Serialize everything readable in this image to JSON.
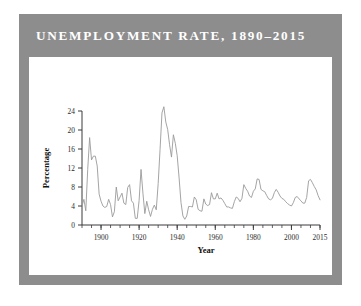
{
  "figure": {
    "title": "UNEMPLOYMENT RATE, 1890–2015",
    "frame_color": "#8d8d8d",
    "title_color": "#ffffff",
    "card_color": "#ffffff",
    "page_background": "#ffffff"
  },
  "chart_data": {
    "type": "line",
    "title": "UNEMPLOYMENT RATE, 1890–2015",
    "xlabel": "Year",
    "ylabel": "Percentage",
    "xlim": [
      1890,
      2015
    ],
    "ylim": [
      0,
      24
    ],
    "xticks": [
      1900,
      1920,
      1940,
      1960,
      1980,
      2000,
      2015
    ],
    "xtick_labels": [
      "1900",
      "1920",
      "1940",
      "1960",
      "1980",
      "2000",
      "2015"
    ],
    "yticks": [
      0,
      4,
      8,
      12,
      16,
      20,
      24
    ],
    "ytick_labels": [
      "0",
      "4",
      "8",
      "12",
      "16",
      "20",
      "24"
    ],
    "x_minor_tick_step": 5,
    "grid": false,
    "legend": false,
    "line_color": "#9a9a9a",
    "series": [
      {
        "name": "Unemployment rate",
        "x": [
          1890,
          1891,
          1892,
          1893,
          1894,
          1895,
          1896,
          1897,
          1898,
          1899,
          1900,
          1901,
          1902,
          1903,
          1904,
          1905,
          1906,
          1907,
          1908,
          1909,
          1910,
          1911,
          1912,
          1913,
          1914,
          1915,
          1916,
          1917,
          1918,
          1919,
          1920,
          1921,
          1922,
          1923,
          1924,
          1925,
          1926,
          1927,
          1928,
          1929,
          1930,
          1931,
          1932,
          1933,
          1934,
          1935,
          1936,
          1937,
          1938,
          1939,
          1940,
          1941,
          1942,
          1943,
          1944,
          1945,
          1946,
          1947,
          1948,
          1949,
          1950,
          1951,
          1952,
          1953,
          1954,
          1955,
          1956,
          1957,
          1958,
          1959,
          1960,
          1961,
          1962,
          1963,
          1964,
          1965,
          1966,
          1967,
          1968,
          1969,
          1970,
          1971,
          1972,
          1973,
          1974,
          1975,
          1976,
          1977,
          1978,
          1979,
          1980,
          1981,
          1982,
          1983,
          1984,
          1985,
          1986,
          1987,
          1988,
          1989,
          1990,
          1991,
          1992,
          1993,
          1994,
          1995,
          1996,
          1997,
          1998,
          1999,
          2000,
          2001,
          2002,
          2003,
          2004,
          2005,
          2006,
          2007,
          2008,
          2009,
          2010,
          2011,
          2012,
          2013,
          2014,
          2015
        ],
        "values": [
          4.0,
          5.4,
          3.0,
          11.7,
          18.4,
          13.7,
          14.5,
          14.5,
          12.4,
          6.5,
          5.0,
          4.0,
          3.7,
          3.9,
          5.4,
          4.3,
          1.7,
          2.8,
          8.0,
          5.1,
          5.9,
          6.7,
          4.6,
          4.3,
          7.9,
          8.5,
          5.1,
          4.6,
          1.4,
          1.4,
          5.2,
          11.7,
          6.7,
          2.4,
          5.0,
          3.2,
          1.8,
          3.3,
          4.2,
          3.2,
          8.7,
          15.9,
          23.6,
          24.9,
          21.7,
          20.1,
          16.9,
          14.3,
          19.0,
          17.2,
          14.6,
          9.9,
          4.7,
          1.9,
          1.2,
          1.9,
          3.9,
          3.9,
          3.8,
          5.9,
          5.3,
          3.3,
          3.0,
          2.9,
          5.5,
          4.4,
          4.1,
          4.3,
          6.8,
          5.5,
          5.5,
          6.7,
          5.5,
          5.7,
          5.2,
          4.5,
          3.8,
          3.8,
          3.6,
          3.5,
          4.9,
          5.9,
          5.6,
          4.9,
          5.6,
          8.5,
          7.7,
          7.1,
          6.1,
          5.8,
          7.1,
          7.6,
          9.7,
          9.6,
          7.5,
          7.2,
          7.0,
          6.2,
          5.5,
          5.3,
          5.6,
          6.8,
          7.5,
          6.9,
          6.1,
          5.6,
          5.4,
          4.9,
          4.5,
          4.2,
          4.0,
          4.7,
          5.8,
          6.0,
          5.5,
          5.1,
          4.6,
          4.6,
          5.8,
          9.3,
          9.6,
          8.9,
          8.1,
          7.4,
          6.2,
          5.3
        ]
      }
    ]
  }
}
